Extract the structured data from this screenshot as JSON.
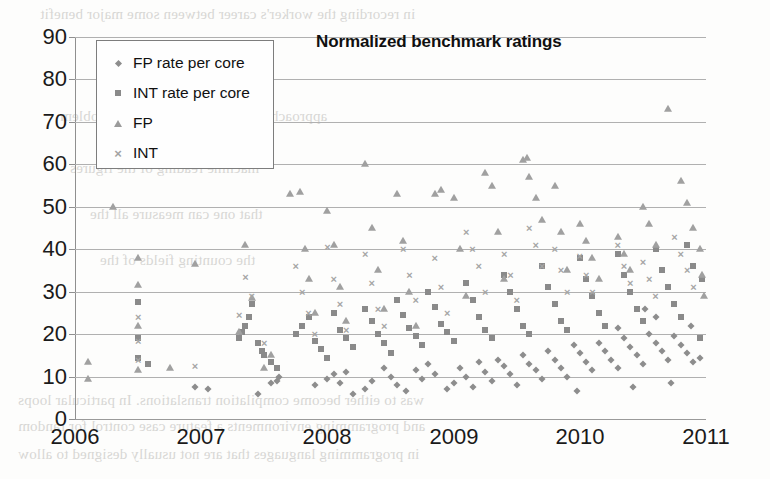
{
  "background_bleed": [
    {
      "text": "in recording the worker's career between some major benefit",
      "x": 40,
      "y": 6
    },
    {
      "text": "approaches have been taken to the problem",
      "x": 60,
      "y": 108
    },
    {
      "text": "machine reading of the figures",
      "x": 70,
      "y": 160
    },
    {
      "text": "that one can measure all the",
      "x": 90,
      "y": 206
    },
    {
      "text": "the counting fields of the",
      "x": 100,
      "y": 252
    },
    {
      "text": "was to either become compilation translations. In particular loops",
      "x": 18,
      "y": 392
    },
    {
      "text": "and programming environments a feature case control for random",
      "x": 18,
      "y": 418
    },
    {
      "text": "in programming languages that are not usually designed to allow",
      "x": 18,
      "y": 446
    }
  ],
  "chart_data": {
    "type": "scatter",
    "title": "Normalized benchmark ratings",
    "xlabel": "",
    "ylabel": "",
    "xlim": [
      2006,
      2011
    ],
    "ylim": [
      0,
      90
    ],
    "xticks": [
      "2006",
      "2007",
      "2008",
      "2009",
      "2010",
      "2011"
    ],
    "yticks": [
      "0",
      "10",
      "20",
      "30",
      "40",
      "50",
      "60",
      "70",
      "80",
      "90"
    ],
    "grid": "horizontal",
    "legend_position": "top-left-inside",
    "series": [
      {
        "name": "FP rate per core",
        "marker": "diamond",
        "color": "#8d8d8d",
        "points": [
          [
            2006.95,
            7.5
          ],
          [
            2007.05,
            7.0
          ],
          [
            2007.55,
            8.5
          ],
          [
            2007.6,
            9.0
          ],
          [
            2007.62,
            10.0
          ],
          [
            2007.9,
            8.0
          ],
          [
            2008.0,
            9.5
          ],
          [
            2008.05,
            10.5
          ],
          [
            2008.1,
            8.5
          ],
          [
            2008.15,
            11.0
          ],
          [
            2008.3,
            7.0
          ],
          [
            2008.35,
            9.0
          ],
          [
            2008.45,
            12.0
          ],
          [
            2008.5,
            10.0
          ],
          [
            2008.55,
            8.0
          ],
          [
            2008.62,
            6.5
          ],
          [
            2008.7,
            11.5
          ],
          [
            2008.75,
            9.5
          ],
          [
            2008.8,
            13.0
          ],
          [
            2008.85,
            10.5
          ],
          [
            2009.0,
            8.5
          ],
          [
            2009.05,
            12.0
          ],
          [
            2009.1,
            10.0
          ],
          [
            2009.15,
            7.5
          ],
          [
            2009.2,
            13.5
          ],
          [
            2009.25,
            11.0
          ],
          [
            2009.3,
            9.0
          ],
          [
            2009.35,
            14.0
          ],
          [
            2009.4,
            12.5
          ],
          [
            2009.45,
            10.5
          ],
          [
            2009.5,
            8.0
          ],
          [
            2009.55,
            15.0
          ],
          [
            2009.6,
            13.0
          ],
          [
            2009.65,
            11.5
          ],
          [
            2009.7,
            9.5
          ],
          [
            2009.75,
            16.0
          ],
          [
            2009.8,
            14.0
          ],
          [
            2009.85,
            12.0
          ],
          [
            2009.9,
            10.0
          ],
          [
            2009.95,
            17.5
          ],
          [
            2010.0,
            15.5
          ],
          [
            2010.05,
            13.5
          ],
          [
            2010.1,
            11.5
          ],
          [
            2010.15,
            18.0
          ],
          [
            2010.2,
            16.0
          ],
          [
            2010.25,
            14.0
          ],
          [
            2010.3,
            12.0
          ],
          [
            2010.35,
            19.0
          ],
          [
            2010.4,
            17.0
          ],
          [
            2010.45,
            15.0
          ],
          [
            2010.5,
            13.0
          ],
          [
            2010.55,
            20.0
          ],
          [
            2010.6,
            18.0
          ],
          [
            2010.65,
            16.0
          ],
          [
            2010.7,
            14.0
          ],
          [
            2010.75,
            19.5
          ],
          [
            2010.8,
            17.5
          ],
          [
            2010.85,
            15.5
          ],
          [
            2010.9,
            13.5
          ],
          [
            2010.95,
            14.5
          ],
          [
            2007.45,
            6.0
          ],
          [
            2008.2,
            6.0
          ],
          [
            2008.95,
            7.0
          ],
          [
            2009.98,
            6.5
          ],
          [
            2010.42,
            7.5
          ],
          [
            2010.72,
            8.5
          ],
          [
            2010.88,
            22.0
          ],
          [
            2010.6,
            24.0
          ],
          [
            2010.52,
            26.0
          ],
          [
            2010.3,
            21.5
          ]
        ]
      },
      {
        "name": "INT rate per core",
        "marker": "square",
        "color": "#8a8a8a",
        "points": [
          [
            2006.5,
            14.5
          ],
          [
            2006.5,
            19.0
          ],
          [
            2006.5,
            27.5
          ],
          [
            2006.58,
            13.0
          ],
          [
            2007.3,
            19.0
          ],
          [
            2007.32,
            20.5
          ],
          [
            2007.35,
            22.0
          ],
          [
            2007.38,
            24.0
          ],
          [
            2007.4,
            27.0
          ],
          [
            2007.45,
            18.0
          ],
          [
            2007.48,
            16.0
          ],
          [
            2007.5,
            15.0
          ],
          [
            2007.55,
            13.5
          ],
          [
            2007.6,
            12.0
          ],
          [
            2007.75,
            20.0
          ],
          [
            2007.8,
            22.0
          ],
          [
            2007.85,
            24.0
          ],
          [
            2007.9,
            18.5
          ],
          [
            2007.95,
            16.5
          ],
          [
            2008.0,
            14.5
          ],
          [
            2008.05,
            25.0
          ],
          [
            2008.1,
            21.0
          ],
          [
            2008.15,
            19.0
          ],
          [
            2008.2,
            17.0
          ],
          [
            2008.3,
            26.0
          ],
          [
            2008.35,
            23.0
          ],
          [
            2008.4,
            20.0
          ],
          [
            2008.45,
            18.0
          ],
          [
            2008.5,
            15.5
          ],
          [
            2008.55,
            28.0
          ],
          [
            2008.6,
            24.5
          ],
          [
            2008.65,
            21.5
          ],
          [
            2008.7,
            19.5
          ],
          [
            2008.75,
            17.5
          ],
          [
            2008.8,
            30.0
          ],
          [
            2008.85,
            26.5
          ],
          [
            2008.9,
            22.5
          ],
          [
            2008.95,
            20.5
          ],
          [
            2009.0,
            18.5
          ],
          [
            2009.1,
            32.0
          ],
          [
            2009.15,
            28.0
          ],
          [
            2009.2,
            24.0
          ],
          [
            2009.25,
            21.0
          ],
          [
            2009.3,
            19.0
          ],
          [
            2009.4,
            34.0
          ],
          [
            2009.45,
            30.0
          ],
          [
            2009.5,
            26.0
          ],
          [
            2009.55,
            22.0
          ],
          [
            2009.6,
            20.0
          ],
          [
            2009.7,
            36.0
          ],
          [
            2009.75,
            31.0
          ],
          [
            2009.8,
            27.0
          ],
          [
            2009.85,
            23.0
          ],
          [
            2009.9,
            21.0
          ],
          [
            2010.0,
            38.0
          ],
          [
            2010.05,
            33.0
          ],
          [
            2010.1,
            29.0
          ],
          [
            2010.15,
            25.0
          ],
          [
            2010.2,
            22.0
          ],
          [
            2010.3,
            39.0
          ],
          [
            2010.35,
            34.0
          ],
          [
            2010.4,
            30.0
          ],
          [
            2010.45,
            26.0
          ],
          [
            2010.5,
            23.0
          ],
          [
            2010.6,
            40.0
          ],
          [
            2010.65,
            35.0
          ],
          [
            2010.7,
            31.0
          ],
          [
            2010.75,
            27.0
          ],
          [
            2010.8,
            24.0
          ],
          [
            2010.85,
            41.0
          ],
          [
            2010.9,
            36.0
          ],
          [
            2010.95,
            19.0
          ],
          [
            2010.97,
            33.0
          ]
        ]
      },
      {
        "name": "FP",
        "marker": "triangle",
        "color": "#a0a0a0",
        "points": [
          [
            2006.1,
            13.5
          ],
          [
            2006.1,
            9.5
          ],
          [
            2006.3,
            50.0
          ],
          [
            2006.5,
            11.5
          ],
          [
            2006.5,
            22.0
          ],
          [
            2006.5,
            31.5
          ],
          [
            2006.5,
            38.0
          ],
          [
            2006.75,
            12.0
          ],
          [
            2006.95,
            36.5
          ],
          [
            2007.3,
            20.5
          ],
          [
            2007.35,
            41.0
          ],
          [
            2007.4,
            28.5
          ],
          [
            2007.5,
            12.0
          ],
          [
            2007.55,
            15.0
          ],
          [
            2007.7,
            53.0
          ],
          [
            2007.78,
            53.5
          ],
          [
            2007.82,
            40.0
          ],
          [
            2007.85,
            33.0
          ],
          [
            2007.9,
            25.0
          ],
          [
            2008.0,
            49.0
          ],
          [
            2008.05,
            41.0
          ],
          [
            2008.1,
            31.0
          ],
          [
            2008.15,
            23.0
          ],
          [
            2008.3,
            60.0
          ],
          [
            2008.35,
            45.0
          ],
          [
            2008.4,
            35.0
          ],
          [
            2008.45,
            26.0
          ],
          [
            2008.55,
            53.0
          ],
          [
            2008.6,
            42.0
          ],
          [
            2008.65,
            30.0
          ],
          [
            2008.7,
            22.0
          ],
          [
            2008.85,
            53.0
          ],
          [
            2008.9,
            54.0
          ],
          [
            2009.0,
            52.0
          ],
          [
            2009.05,
            40.0
          ],
          [
            2009.1,
            29.0
          ],
          [
            2009.25,
            58.0
          ],
          [
            2009.3,
            55.0
          ],
          [
            2009.35,
            44.0
          ],
          [
            2009.4,
            33.0
          ],
          [
            2009.55,
            61.0
          ],
          [
            2009.58,
            61.5
          ],
          [
            2009.6,
            57.0
          ],
          [
            2009.65,
            52.0
          ],
          [
            2009.7,
            47.0
          ],
          [
            2009.8,
            55.0
          ],
          [
            2009.85,
            44.0
          ],
          [
            2009.9,
            35.0
          ],
          [
            2010.0,
            46.0
          ],
          [
            2010.05,
            42.0
          ],
          [
            2010.1,
            38.0
          ],
          [
            2010.15,
            33.0
          ],
          [
            2010.3,
            43.0
          ],
          [
            2010.35,
            39.0
          ],
          [
            2010.4,
            35.0
          ],
          [
            2010.5,
            50.0
          ],
          [
            2010.55,
            46.0
          ],
          [
            2010.6,
            41.0
          ],
          [
            2010.7,
            73.0
          ],
          [
            2010.8,
            56.0
          ],
          [
            2010.85,
            51.0
          ],
          [
            2010.9,
            45.0
          ],
          [
            2010.95,
            40.0
          ],
          [
            2010.97,
            34.0
          ],
          [
            2010.98,
            29.0
          ]
        ]
      },
      {
        "name": "INT",
        "marker": "x",
        "color": "#a5a5a5",
        "points": [
          [
            2006.5,
            14.0
          ],
          [
            2006.5,
            18.5
          ],
          [
            2006.5,
            24.0
          ],
          [
            2006.95,
            12.5
          ],
          [
            2007.3,
            24.5
          ],
          [
            2007.35,
            33.5
          ],
          [
            2007.4,
            29.0
          ],
          [
            2007.5,
            18.0
          ],
          [
            2007.75,
            36.0
          ],
          [
            2007.8,
            30.0
          ],
          [
            2007.85,
            25.0
          ],
          [
            2007.9,
            20.0
          ],
          [
            2008.0,
            40.5
          ],
          [
            2008.05,
            33.0
          ],
          [
            2008.1,
            27.0
          ],
          [
            2008.15,
            21.0
          ],
          [
            2008.3,
            39.0
          ],
          [
            2008.35,
            32.0
          ],
          [
            2008.4,
            26.0
          ],
          [
            2008.45,
            22.0
          ],
          [
            2008.6,
            40.0
          ],
          [
            2008.65,
            34.0
          ],
          [
            2008.7,
            28.0
          ],
          [
            2008.85,
            38.0
          ],
          [
            2008.9,
            31.0
          ],
          [
            2008.95,
            25.0
          ],
          [
            2009.1,
            44.0
          ],
          [
            2009.15,
            40.0
          ],
          [
            2009.2,
            36.0
          ],
          [
            2009.25,
            30.0
          ],
          [
            2009.4,
            39.0
          ],
          [
            2009.45,
            34.0
          ],
          [
            2009.5,
            28.0
          ],
          [
            2009.6,
            45.0
          ],
          [
            2009.65,
            41.0
          ],
          [
            2009.7,
            36.0
          ],
          [
            2009.8,
            40.0
          ],
          [
            2009.85,
            35.0
          ],
          [
            2009.9,
            30.0
          ],
          [
            2010.0,
            38.5
          ],
          [
            2010.05,
            34.0
          ],
          [
            2010.1,
            30.0
          ],
          [
            2010.3,
            41.0
          ],
          [
            2010.35,
            36.0
          ],
          [
            2010.4,
            32.0
          ],
          [
            2010.5,
            37.0
          ],
          [
            2010.55,
            33.0
          ],
          [
            2010.6,
            29.0
          ],
          [
            2010.75,
            43.0
          ],
          [
            2010.8,
            39.0
          ],
          [
            2010.85,
            35.0
          ],
          [
            2010.9,
            31.0
          ]
        ]
      }
    ]
  }
}
